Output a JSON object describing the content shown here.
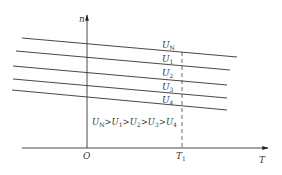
{
  "diagram": {
    "type": "speed-torque characteristic (n vs T) for varying voltages",
    "axes": {
      "y_label": "n",
      "x_label": "T",
      "origin_label": "O",
      "x_tick_label": {
        "main": "T",
        "sub": "1"
      }
    },
    "curves": [
      {
        "label_main": "U",
        "label_sub": "N",
        "x1": 22,
        "y1": 38,
        "x2": 237,
        "y2": 57,
        "lx": 162,
        "ly": 48
      },
      {
        "label_main": "U",
        "label_sub": "1",
        "x1": 16,
        "y1": 51,
        "x2": 230,
        "y2": 70,
        "lx": 162,
        "ly": 62
      },
      {
        "label_main": "U",
        "label_sub": "2",
        "x1": 13,
        "y1": 66,
        "x2": 227,
        "y2": 85,
        "lx": 162,
        "ly": 76
      },
      {
        "label_main": "U",
        "label_sub": "3",
        "x1": 13,
        "y1": 79,
        "x2": 227,
        "y2": 98,
        "lx": 162,
        "ly": 90
      },
      {
        "label_main": "U",
        "label_sub": "4",
        "x1": 12,
        "y1": 90,
        "x2": 227,
        "y2": 110,
        "lx": 162,
        "ly": 103
      }
    ],
    "relation": [
      {
        "main": "U",
        "sub": "N"
      },
      {
        "op": ">"
      },
      {
        "main": "U",
        "sub": "1"
      },
      {
        "op": ">"
      },
      {
        "main": "U",
        "sub": "2"
      },
      {
        "op": ">"
      },
      {
        "main": "U",
        "sub": "3"
      },
      {
        "op": ">"
      },
      {
        "main": "U",
        "sub": "4"
      }
    ],
    "colors": {
      "line": "#333333",
      "background": "#ffffff"
    }
  }
}
